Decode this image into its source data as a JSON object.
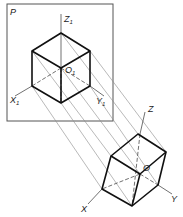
{
  "figure": {
    "plane_label": "P",
    "plane_axes": {
      "z": "Z",
      "z_sub": "1",
      "x": "X",
      "x_sub": "1",
      "y": "Y",
      "y_sub": "1",
      "o": "O",
      "o_sub": "1"
    },
    "space_axes": {
      "z": "Z",
      "x": "X",
      "y": "Y",
      "o": "O"
    },
    "colors": {
      "edge": "#111111",
      "axis": "#333333",
      "projector": "#8a8a8a",
      "frame": "#555555"
    }
  }
}
